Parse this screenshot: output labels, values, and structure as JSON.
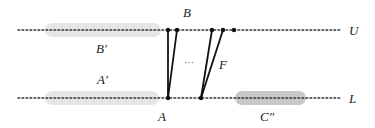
{
  "diagram": {
    "lines": {
      "upper": {
        "label": "U",
        "y": 30,
        "x1": 18,
        "x2": 340
      },
      "lower": {
        "label": "L",
        "y": 98,
        "x1": 18,
        "x2": 340
      }
    },
    "regions": [
      {
        "id": "upper-left-region",
        "x": 45,
        "y": 23,
        "w": 116,
        "h": 14,
        "color": "#e6e6e6"
      },
      {
        "id": "lower-left-region",
        "x": 45,
        "y": 91,
        "w": 114,
        "h": 14,
        "color": "#e6e6e6"
      },
      {
        "id": "c-double-prime-region",
        "x": 235,
        "y": 91,
        "w": 71,
        "h": 14,
        "color": "#c8c8c8"
      }
    ],
    "labels": {
      "B": "B",
      "B_prime": "B′",
      "A_prime": "A′",
      "A": "A",
      "F": "F",
      "C_double_prime": "C″",
      "ellipsis": "···",
      "U": "U",
      "L": "L"
    },
    "upper_points": [
      168,
      177,
      212,
      223,
      234
    ],
    "lower_points": [
      168,
      201
    ],
    "edges": [
      {
        "from": [
          168,
          98
        ],
        "to": [
          168,
          30
        ]
      },
      {
        "from": [
          168,
          98
        ],
        "to": [
          177,
          30
        ]
      },
      {
        "from": [
          201,
          98
        ],
        "to": [
          212,
          30
        ]
      },
      {
        "from": [
          201,
          98
        ],
        "to": [
          223,
          30
        ]
      }
    ],
    "colors": {
      "line": "#333333",
      "edge": "#111111",
      "region_light": "#e6e6e6",
      "region_dark": "#c8c8c8",
      "text": "#222222"
    }
  }
}
